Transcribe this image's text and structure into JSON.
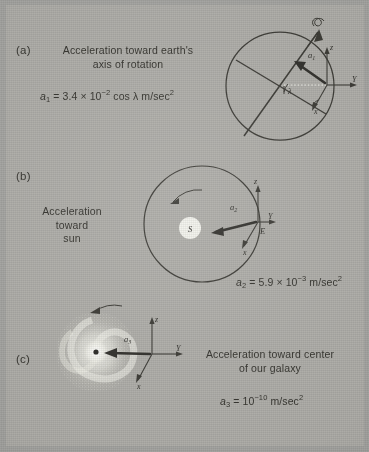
{
  "figure": {
    "background_color": "#adaca7",
    "ink_color": "#33322d"
  },
  "panels": [
    {
      "id": "a",
      "label": "(a)",
      "caption_line1": "Acceleration toward earth's",
      "caption_line2": "axis of rotation",
      "equation": {
        "symbol": "a",
        "symbol_sub": "1",
        "equals": "=",
        "coefficient": "3.4",
        "times": "×",
        "base": "10",
        "exponent": "−2",
        "factor": "cos λ",
        "units": "m/sec",
        "units_exponent": "2",
        "full_text": "a₁ = 3.4 × 10⁻² cos λ m/sec²"
      },
      "diagram": {
        "type": "earth-rotation",
        "body_label": "",
        "vector_label": "a",
        "vector_label_sub": "1",
        "angle_label": "λ",
        "axes": [
          "z",
          "Y",
          "x"
        ],
        "spin_arrow": "curved-rotation-arrow-about-polar-axis"
      }
    },
    {
      "id": "b",
      "label": "(b)",
      "caption_line1": "Acceleration",
      "caption_line2": "toward",
      "caption_line3": "sun",
      "equation": {
        "symbol": "a",
        "symbol_sub": "2",
        "equals": "=",
        "coefficient": "5.9",
        "times": "×",
        "base": "10",
        "exponent": "−3",
        "units": "m/sec",
        "units_exponent": "2",
        "full_text": "a₂ = 5.9 × 10⁻³ m/sec²"
      },
      "diagram": {
        "type": "earth-orbit-sun",
        "sun_label": "S",
        "earth_label": "E",
        "vector_label": "a",
        "vector_label_sub": "2",
        "axes": [
          "z",
          "Y",
          "x"
        ],
        "orbit_arrow": "counterclockwise"
      }
    },
    {
      "id": "c",
      "label": "(c)",
      "caption_line1": "Acceleration toward center",
      "caption_line2": "of our galaxy",
      "equation": {
        "symbol": "a",
        "symbol_sub": "3",
        "equals": "=",
        "base": "10",
        "exponent": "−10",
        "units": "m/sec",
        "units_exponent": "2",
        "full_text": "a₃ = 10⁻¹⁰ m/sec²"
      },
      "diagram": {
        "type": "spiral-galaxy",
        "vector_label": "a",
        "vector_label_sub": "3",
        "axes": [
          "z",
          "Y",
          "x"
        ],
        "rotation_arrow": "leftward-curved"
      }
    }
  ]
}
